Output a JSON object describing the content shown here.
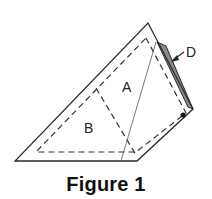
{
  "figure": {
    "caption": "Figure 1",
    "labels": {
      "region_a": "A",
      "region_b": "B",
      "flap_d": "D"
    },
    "colors": {
      "outline": "#2a2a2a",
      "dashed": "#333333",
      "flap_fill": "#8a8a8a",
      "dot": "#111111"
    }
  }
}
